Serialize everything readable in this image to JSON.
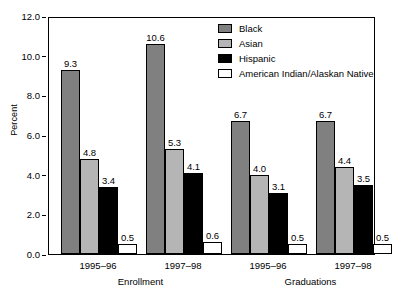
{
  "chart_data": {
    "type": "bar",
    "title": "",
    "xlabel": "",
    "ylabel": "Percent",
    "ylim": [
      0,
      12
    ],
    "ytick_step": 2.0,
    "grid": false,
    "legend_position": "top-right",
    "yticks": [
      "0.0",
      "2.0",
      "4.0",
      "6.0",
      "8.0",
      "10.0",
      "12.0"
    ],
    "ytick_values": [
      0,
      2,
      4,
      6,
      8,
      10,
      12
    ],
    "categories": [
      "1995–96",
      "1997–98",
      "1995–96",
      "1997–98"
    ],
    "sections": [
      {
        "label": "Enrollment",
        "categories": [
          "1995–96",
          "1997–98"
        ]
      },
      {
        "label": "Graduations",
        "categories": [
          "1995–96",
          "1997–98"
        ]
      }
    ],
    "series": [
      {
        "name": "Black",
        "color": "#808080",
        "values": [
          9.3,
          10.6,
          6.7,
          6.7
        ],
        "labels": [
          "9.3",
          "10.6",
          "6.7",
          "6.7"
        ]
      },
      {
        "name": "Asian",
        "color": "#b5b5b5",
        "values": [
          4.8,
          5.3,
          4.0,
          4.4
        ],
        "labels": [
          "4.8",
          "5.3",
          "4.0",
          "4.4"
        ]
      },
      {
        "name": "Hispanic",
        "color": "#000000",
        "values": [
          3.4,
          4.1,
          3.1,
          3.5
        ],
        "labels": [
          "3.4",
          "4.1",
          "3.1",
          "3.5"
        ]
      },
      {
        "name": "American Indian/Alaskan Native",
        "color": "#ffffff",
        "values": [
          0.5,
          0.6,
          0.5,
          0.5
        ],
        "labels": [
          "0.5",
          "0.6",
          "0.5",
          "0.5"
        ]
      }
    ]
  },
  "legend": {
    "items": [
      {
        "label": "Black",
        "color": "#808080"
      },
      {
        "label": "Asian",
        "color": "#b5b5b5"
      },
      {
        "label": "Hispanic",
        "color": "#000000"
      },
      {
        "label": "American Indian/Alaskan Native",
        "color": "#ffffff"
      }
    ]
  }
}
